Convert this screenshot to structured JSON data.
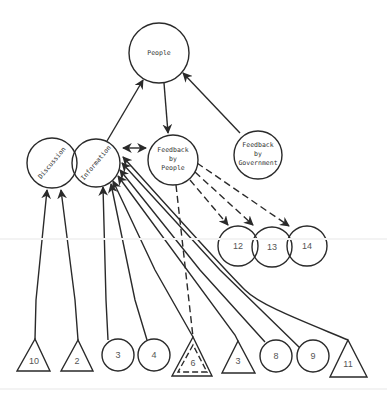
{
  "diagram": {
    "title": "",
    "nodes": {
      "people": {
        "label": "People",
        "shape": "circle"
      },
      "discussion": {
        "label": "Discussion",
        "shape": "circle"
      },
      "information": {
        "label": "Information",
        "shape": "circle"
      },
      "feedback_people": {
        "line1": "Feedback",
        "line2": "by",
        "line3": "People",
        "shape": "circle"
      },
      "feedback_government": {
        "line1": "Feedback",
        "line2": "by",
        "line3": "Government",
        "shape": "circle"
      },
      "n12": {
        "label": "12",
        "shape": "circle"
      },
      "n13": {
        "label": "13",
        "shape": "circle"
      },
      "n14": {
        "label": "14",
        "shape": "circle"
      },
      "n10": {
        "label": "10",
        "shape": "triangle"
      },
      "n2": {
        "label": "2",
        "shape": "triangle"
      },
      "n3a": {
        "label": "3",
        "shape": "circle"
      },
      "n4": {
        "label": "4",
        "shape": "circle"
      },
      "n6": {
        "label": "6",
        "shape": "double-dashed-triangle"
      },
      "n3b": {
        "label": "3",
        "shape": "triangle"
      },
      "n8": {
        "label": "8",
        "shape": "circle"
      },
      "n9": {
        "label": "9",
        "shape": "circle"
      },
      "n11": {
        "label": "11",
        "shape": "triangle"
      }
    },
    "edges": [
      {
        "from": "information",
        "to": "people",
        "style": "solid",
        "arrow": "end"
      },
      {
        "from": "people",
        "to": "feedback_people",
        "style": "solid",
        "arrow": "end"
      },
      {
        "from": "feedback_government",
        "to": "people",
        "style": "solid",
        "arrow": "end"
      },
      {
        "from": "information",
        "to": "feedback_people",
        "style": "solid",
        "arrow": "both"
      },
      {
        "from": "feedback_people",
        "to": "n12",
        "style": "dashed",
        "arrow": "end"
      },
      {
        "from": "feedback_people",
        "to": "n13",
        "style": "dashed",
        "arrow": "end"
      },
      {
        "from": "feedback_people",
        "to": "n14",
        "style": "dashed",
        "arrow": "end"
      },
      {
        "from": "feedback_people",
        "to": "n6",
        "style": "dashed",
        "arrow": "none"
      },
      {
        "from": "n10",
        "to": "discussion",
        "style": "solid",
        "arrow": "end"
      },
      {
        "from": "n2",
        "to": "discussion",
        "style": "solid",
        "arrow": "end"
      },
      {
        "from": "n3a",
        "to": "information",
        "style": "solid",
        "arrow": "end"
      },
      {
        "from": "n4",
        "to": "information",
        "style": "solid",
        "arrow": "end"
      },
      {
        "from": "n6",
        "to": "information",
        "style": "solid",
        "arrow": "end"
      },
      {
        "from": "n3b",
        "to": "information",
        "style": "solid",
        "arrow": "end"
      },
      {
        "from": "n8",
        "to": "information",
        "style": "solid",
        "arrow": "end"
      },
      {
        "from": "n9",
        "to": "information",
        "style": "solid",
        "arrow": "end"
      },
      {
        "from": "n11",
        "to": "information",
        "style": "solid",
        "arrow": "end"
      }
    ],
    "colors": {
      "stroke": "#2a2a2a",
      "text": "#333333",
      "background": "#ffffff"
    }
  }
}
